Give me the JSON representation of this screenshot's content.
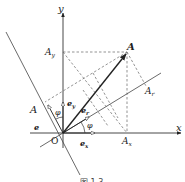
{
  "diagram": {
    "type": "vector-decomposition",
    "axes": {
      "x_label": "x",
      "y_label": "y",
      "origin_label": "O"
    },
    "point": {
      "label": "A"
    },
    "projections": {
      "on_x": "A",
      "on_x_sub": "x",
      "on_y": "A",
      "on_y_sub": "y",
      "on_r": "A",
      "on_r_sub": "r",
      "on_perp": "A"
    },
    "unit_vectors": {
      "ex": "e",
      "ex_sub": "x",
      "ey": "e",
      "ey_sub": "y",
      "er": "e",
      "er_sub": "r",
      "eperp": "e"
    },
    "angles": {
      "phi_x": "φ",
      "phi_y": "φ"
    },
    "caption": "图 1.3",
    "colors": {
      "line": "#333333",
      "dashed": "#666666",
      "background": "#ffffff"
    }
  }
}
